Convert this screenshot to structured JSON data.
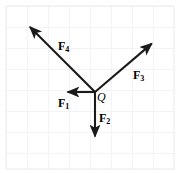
{
  "figure": {
    "width": 181,
    "height": 173,
    "background_color": "#ffffff",
    "line_color": "#1a1a1a",
    "grid": {
      "visible": true,
      "color": "#f0f0f2",
      "spacing": 21,
      "x_start": 6,
      "y_start": 6,
      "x_end": 174,
      "y_end": 169
    },
    "origin": {
      "label": "Q",
      "x": 95,
      "y": 92
    },
    "vectors": [
      {
        "name": "F1",
        "label_main": "F",
        "label_sub": "1",
        "x1": 95,
        "y1": 92,
        "x2": 62,
        "y2": 92,
        "label_x": 58,
        "label_y": 97,
        "direction": "left"
      },
      {
        "name": "F2",
        "label_main": "F",
        "label_sub": "2",
        "x1": 95,
        "y1": 92,
        "x2": 95,
        "y2": 142,
        "label_x": 99,
        "label_y": 112,
        "direction": "down"
      },
      {
        "name": "F3",
        "label_main": "F",
        "label_sub": "3",
        "x1": 95,
        "y1": 92,
        "x2": 156,
        "y2": 40,
        "label_x": 133,
        "label_y": 69,
        "direction": "up-right"
      },
      {
        "name": "F4",
        "label_main": "F",
        "label_sub": "4",
        "x1": 95,
        "y1": 92,
        "x2": 26,
        "y2": 23,
        "label_x": 58,
        "label_y": 40,
        "direction": "up-left"
      }
    ]
  }
}
